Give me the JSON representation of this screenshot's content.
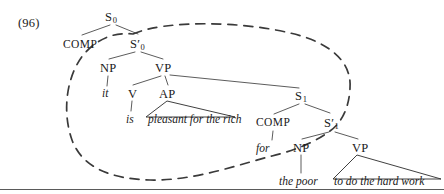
{
  "figure": {
    "example_number": "(96)",
    "nodes": [
      {
        "id": "S0",
        "text": "S",
        "sub": "0",
        "prime": false,
        "x": 105,
        "y": 11,
        "kind": "category"
      },
      {
        "id": "COMP0",
        "text": "COMP",
        "sub": "",
        "prime": false,
        "x": 63,
        "y": 39,
        "kind": "comp"
      },
      {
        "id": "Sbar0",
        "text": "S",
        "sub": "0",
        "prime": true,
        "x": 130,
        "y": 38,
        "kind": "category"
      },
      {
        "id": "NP0",
        "text": "NP",
        "sub": "",
        "prime": false,
        "x": 100,
        "y": 62,
        "kind": "category"
      },
      {
        "id": "VP0",
        "text": "VP",
        "sub": "",
        "prime": false,
        "x": 155,
        "y": 62,
        "kind": "category"
      },
      {
        "id": "it",
        "text": "it",
        "sub": "",
        "prime": false,
        "x": 102,
        "y": 88,
        "kind": "terminal"
      },
      {
        "id": "V0",
        "text": "V",
        "sub": "",
        "prime": false,
        "x": 128,
        "y": 88,
        "kind": "category"
      },
      {
        "id": "AP0",
        "text": "AP",
        "sub": "",
        "prime": false,
        "x": 159,
        "y": 88,
        "kind": "category"
      },
      {
        "id": "is",
        "text": "is",
        "sub": "",
        "prime": false,
        "x": 126,
        "y": 114,
        "kind": "terminal"
      },
      {
        "id": "apText",
        "text": "pleasant for the rich",
        "sub": "",
        "prime": false,
        "x": 148,
        "y": 114,
        "kind": "terminal"
      },
      {
        "id": "S1",
        "text": "S",
        "sub": "1",
        "prime": false,
        "x": 295,
        "y": 90,
        "kind": "category"
      },
      {
        "id": "COMP1",
        "text": "COMP",
        "sub": "",
        "prime": false,
        "x": 256,
        "y": 117,
        "kind": "comp"
      },
      {
        "id": "Sbar1",
        "text": "S",
        "sub": "1",
        "prime": true,
        "x": 324,
        "y": 117,
        "kind": "category"
      },
      {
        "id": "for",
        "text": "for",
        "sub": "",
        "prime": false,
        "x": 256,
        "y": 143,
        "kind": "terminal"
      },
      {
        "id": "NP1",
        "text": "NP",
        "sub": "",
        "prime": false,
        "x": 293,
        "y": 142,
        "kind": "category"
      },
      {
        "id": "VP1",
        "text": "VP",
        "sub": "",
        "prime": false,
        "x": 352,
        "y": 142,
        "kind": "category"
      },
      {
        "id": "thePoor",
        "text": "the poor",
        "sub": "",
        "prime": false,
        "x": 279,
        "y": 176,
        "kind": "terminal"
      },
      {
        "id": "vpText",
        "text": "to do the hard work",
        "sub": "",
        "prime": false,
        "x": 334,
        "y": 176,
        "kind": "terminal"
      }
    ],
    "branches": [
      {
        "from": "S0",
        "to": "COMP0",
        "x1": 110,
        "y1": 25,
        "x2": 82,
        "y2": 35
      },
      {
        "from": "S0",
        "to": "Sbar0",
        "x1": 116,
        "y1": 25,
        "x2": 138,
        "y2": 34
      },
      {
        "from": "Sbar0",
        "to": "NP0",
        "x1": 135,
        "y1": 52,
        "x2": 109,
        "y2": 59
      },
      {
        "from": "Sbar0",
        "to": "VP0",
        "x1": 141,
        "y1": 52,
        "x2": 163,
        "y2": 59
      },
      {
        "from": "NP0",
        "to": "it",
        "x1": 108,
        "y1": 76,
        "x2": 107,
        "y2": 86
      },
      {
        "from": "VP0",
        "to": "V0",
        "x1": 161,
        "y1": 76,
        "x2": 133,
        "y2": 85
      },
      {
        "from": "VP0",
        "to": "AP0",
        "x1": 165,
        "y1": 76,
        "x2": 168,
        "y2": 85
      },
      {
        "from": "VP0",
        "to": "S1",
        "x1": 170,
        "y1": 75,
        "x2": 299,
        "y2": 88
      },
      {
        "from": "V0",
        "to": "is",
        "x1": 132,
        "y1": 101,
        "x2": 131,
        "y2": 111
      },
      {
        "from": "S1",
        "to": "COMP1",
        "x1": 299,
        "y1": 104,
        "x2": 274,
        "y2": 114
      },
      {
        "from": "S1",
        "to": "Sbar1",
        "x1": 305,
        "y1": 104,
        "x2": 330,
        "y2": 113
      },
      {
        "from": "COMP1",
        "to": "for",
        "x1": 273,
        "y1": 131,
        "x2": 272,
        "y2": 140
      },
      {
        "from": "Sbar1",
        "to": "NP1",
        "x1": 329,
        "y1": 132,
        "x2": 302,
        "y2": 139
      },
      {
        "from": "Sbar1",
        "to": "VP1",
        "x1": 335,
        "y1": 132,
        "x2": 358,
        "y2": 139
      },
      {
        "from": "NP1",
        "to": "thePoor",
        "x1": 301,
        "y1": 155,
        "x2": 301,
        "y2": 173
      }
    ],
    "triangles": [
      {
        "for": "AP0",
        "apex_x": 167,
        "apex_y": 101,
        "left_x": 146,
        "left_y": 117,
        "right_x": 235,
        "right_y": 117
      },
      {
        "for": "VP1",
        "apex_x": 357,
        "apex_y": 155,
        "left_x": 333,
        "left_y": 179,
        "right_x": 441,
        "right_y": 179
      }
    ],
    "enclosure": {
      "style": "dashed-ellipse",
      "encircles": [
        "Sbar0",
        "NP0",
        "VP0",
        "it",
        "V0",
        "AP0",
        "is",
        "S1",
        "COMP1",
        "Sbar1"
      ],
      "dash_pattern": "9 7",
      "path": "M 133 34 C 165 20, 240 21, 290 33 C 330 42, 352 62, 350 88 C 349 110, 340 124, 330 131 C 318 140, 300 149, 272 156 C 240 164, 195 181, 150 180 C 110 179, 82 167, 72 140 C 62 112, 66 76, 84 54 C 98 38, 115 32, 133 34 Z"
    },
    "rule_line": {
      "y": 189
    },
    "colors": {
      "ink": "#1a1a1a",
      "line": "#4a4a4a",
      "dash": "#3a3a3a"
    }
  }
}
